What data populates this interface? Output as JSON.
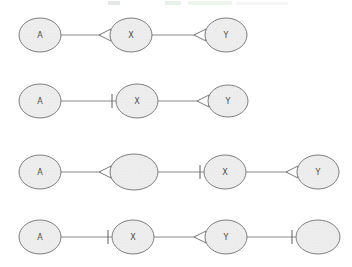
{
  "figure": {
    "background_color": "#ffffff",
    "node_fill_color": "#e9e9e9",
    "node_stroke_color": "#6f6f6f",
    "edge_color": "#7a7a7a",
    "label_color": "#4a4a4a",
    "rows": [
      {
        "row_label": "row-1",
        "nodes": [
          {
            "id": "r1n1",
            "label": "A",
            "cx": 40,
            "cy": 35,
            "rx": 21,
            "ry": 17
          },
          {
            "id": "r1n2",
            "label": "X",
            "cx": 131,
            "cy": 35,
            "rx": 21,
            "ry": 17
          },
          {
            "id": "r1n3",
            "label": "Y",
            "cx": 226,
            "cy": 35,
            "rx": 21,
            "ry": 17
          }
        ],
        "edges": [
          {
            "from": "r1n1",
            "to": "r1n2",
            "marker": "arrow",
            "x1": 61,
            "x2": 110,
            "y": 35
          },
          {
            "from": "r1n2",
            "to": "r1n3",
            "marker": "arrow",
            "x1": 152,
            "x2": 205,
            "y": 35
          }
        ]
      },
      {
        "row_label": "row-2",
        "nodes": [
          {
            "id": "r2n1",
            "label": "A",
            "cx": 40,
            "cy": 101,
            "rx": 21,
            "ry": 17
          },
          {
            "id": "r2n2",
            "label": "X",
            "cx": 137,
            "cy": 101,
            "rx": 21,
            "ry": 17
          },
          {
            "id": "r2n3",
            "label": "Y",
            "cx": 228,
            "cy": 101,
            "rx": 20,
            "ry": 16
          }
        ],
        "edges": [
          {
            "from": "r2n1",
            "to": "r2n2",
            "marker": "tick",
            "x1": 61,
            "x2": 116,
            "y": 101
          },
          {
            "from": "r2n2",
            "to": "r2n3",
            "marker": "arrow",
            "x1": 158,
            "x2": 208,
            "y": 101
          }
        ]
      },
      {
        "row_label": "row-3",
        "nodes": [
          {
            "id": "r3n1",
            "label": "A",
            "cx": 40,
            "cy": 172,
            "rx": 21,
            "ry": 17
          },
          {
            "id": "r3n2",
            "label": "",
            "cx": 134,
            "cy": 172,
            "rx": 24,
            "ry": 18
          },
          {
            "id": "r3n3",
            "label": "X",
            "cx": 225,
            "cy": 172,
            "rx": 21,
            "ry": 17
          },
          {
            "id": "r3n4",
            "label": "Y",
            "cx": 318,
            "cy": 172,
            "rx": 21,
            "ry": 17
          }
        ],
        "edges": [
          {
            "from": "r3n1",
            "to": "r3n2",
            "marker": "arrow",
            "x1": 61,
            "x2": 110,
            "y": 172
          },
          {
            "from": "r3n2",
            "to": "r3n3",
            "marker": "tick",
            "x1": 158,
            "x2": 204,
            "y": 172
          },
          {
            "from": "r3n3",
            "to": "r3n4",
            "marker": "arrow",
            "x1": 246,
            "x2": 297,
            "y": 172
          }
        ]
      },
      {
        "row_label": "row-4",
        "nodes": [
          {
            "id": "r4n1",
            "label": "A",
            "cx": 40,
            "cy": 237,
            "rx": 21,
            "ry": 17
          },
          {
            "id": "r4n2",
            "label": "X",
            "cx": 133,
            "cy": 237,
            "rx": 21,
            "ry": 17
          },
          {
            "id": "r4n3",
            "label": "Y",
            "cx": 226,
            "cy": 237,
            "rx": 21,
            "ry": 17
          },
          {
            "id": "r4n4",
            "label": "",
            "cx": 318,
            "cy": 237,
            "rx": 22,
            "ry": 17
          }
        ],
        "edges": [
          {
            "from": "r4n1",
            "to": "r4n2",
            "marker": "tick",
            "x1": 61,
            "x2": 112,
            "y": 237
          },
          {
            "from": "r4n2",
            "to": "r4n3",
            "marker": "arrow",
            "x1": 154,
            "x2": 205,
            "y": 237
          },
          {
            "from": "r4n3",
            "to": "r4n4",
            "marker": "tick",
            "x1": 247,
            "x2": 296,
            "y": 237
          }
        ]
      }
    ]
  }
}
